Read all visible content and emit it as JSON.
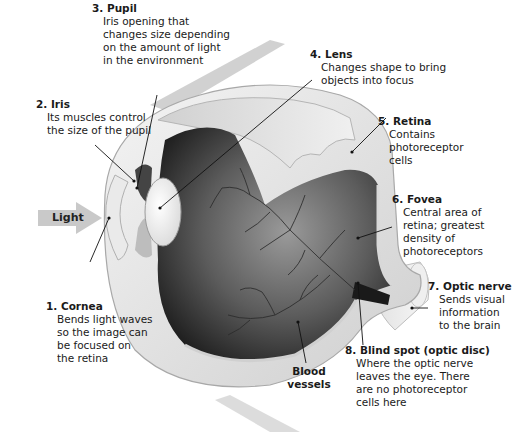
{
  "diagram": {
    "light_arrow": {
      "label": "Light",
      "color": "#c9c9c9"
    },
    "labels": [
      {
        "number": "1.",
        "title": "Cornea",
        "description": "Bends light waves so the image can be focused on the retina",
        "lines": [
          "Bends light waves",
          "so the image can",
          "be focused on",
          "the retina"
        ]
      },
      {
        "number": "2.",
        "title": "Iris",
        "description": "Its muscles control the size of the pupil",
        "lines": [
          "Its muscles control",
          "the size of the pupil"
        ]
      },
      {
        "number": "3.",
        "title": "Pupil",
        "description": "Iris opening that changes size depending on the amount of light in the environment",
        "lines": [
          "Iris opening that",
          "changes size depending",
          "on the amount of light",
          "in the environment"
        ]
      },
      {
        "number": "4.",
        "title": "Lens",
        "description": "Changes shape to bring objects into focus",
        "lines": [
          "Changes shape to bring",
          "objects into focus"
        ]
      },
      {
        "number": "5.",
        "title": "Retina",
        "description": "Contains photoreceptor cells",
        "lines": [
          "Contains",
          "photoreceptor",
          "cells"
        ]
      },
      {
        "number": "6.",
        "title": "Fovea",
        "description": "Central area of retina; greatest density of photoreceptors",
        "lines": [
          "Central area of",
          "retina; greatest",
          "density of",
          "photoreceptors"
        ]
      },
      {
        "number": "7.",
        "title": "Optic nerve",
        "description": "Sends visual information to the brain",
        "lines": [
          "Sends visual",
          "information",
          "to the brain"
        ]
      },
      {
        "number": "8.",
        "title": "Blind spot (optic disc)",
        "description": "Where the optic nerve leaves the eye. There are no photoreceptor cells here",
        "lines": [
          "Where the optic nerve",
          "leaves the eye. There",
          "are no photoreceptor",
          "cells here"
        ]
      }
    ],
    "extra_labels": {
      "blood_vessels": [
        "Blood",
        "vessels"
      ]
    },
    "colors": {
      "sclera": "#e6e6e6",
      "interior_dark": "#3a3a3a",
      "vessels": "#2a2a2a",
      "leader_lines": "#111111"
    }
  }
}
